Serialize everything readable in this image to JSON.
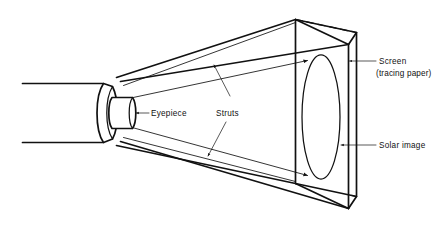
{
  "figure": {
    "type": "technical-line-diagram",
    "background_color": "#ffffff",
    "line_color": "#111111"
  },
  "labels": {
    "eyepiece": "Eyepiece",
    "struts": "Struts",
    "screen": "Screen",
    "screen_sub": "(tracing paper)",
    "solar_image": "Solar image"
  },
  "parts": [
    {
      "id": "telescope-tube",
      "name": "Telescope tube"
    },
    {
      "id": "eyepiece-barrel",
      "name": "Eyepiece"
    },
    {
      "id": "projection-cone",
      "name": "Projection cone"
    },
    {
      "id": "strut-upper",
      "name": "Upper strut"
    },
    {
      "id": "strut-lower",
      "name": "Lower strut"
    },
    {
      "id": "screen-box",
      "name": "Screen (tracing paper)"
    },
    {
      "id": "solar-image-ellipse",
      "name": "Solar image"
    }
  ],
  "annotations": [
    {
      "id": "eyepiece-leader",
      "target": "eyepiece-barrel",
      "label": "Eyepiece",
      "arrow": "left"
    },
    {
      "id": "struts-leader-upper",
      "target": "strut-upper",
      "label": "Struts",
      "arrow": "up-left"
    },
    {
      "id": "struts-leader-lower",
      "target": "strut-lower",
      "label": "Struts",
      "arrow": "down-left"
    },
    {
      "id": "screen-leader",
      "target": "screen-box",
      "label": "Screen",
      "arrow": "left"
    },
    {
      "id": "solar-image-leader",
      "target": "solar-image-ellipse",
      "label": "Solar image",
      "arrow": "left"
    }
  ]
}
